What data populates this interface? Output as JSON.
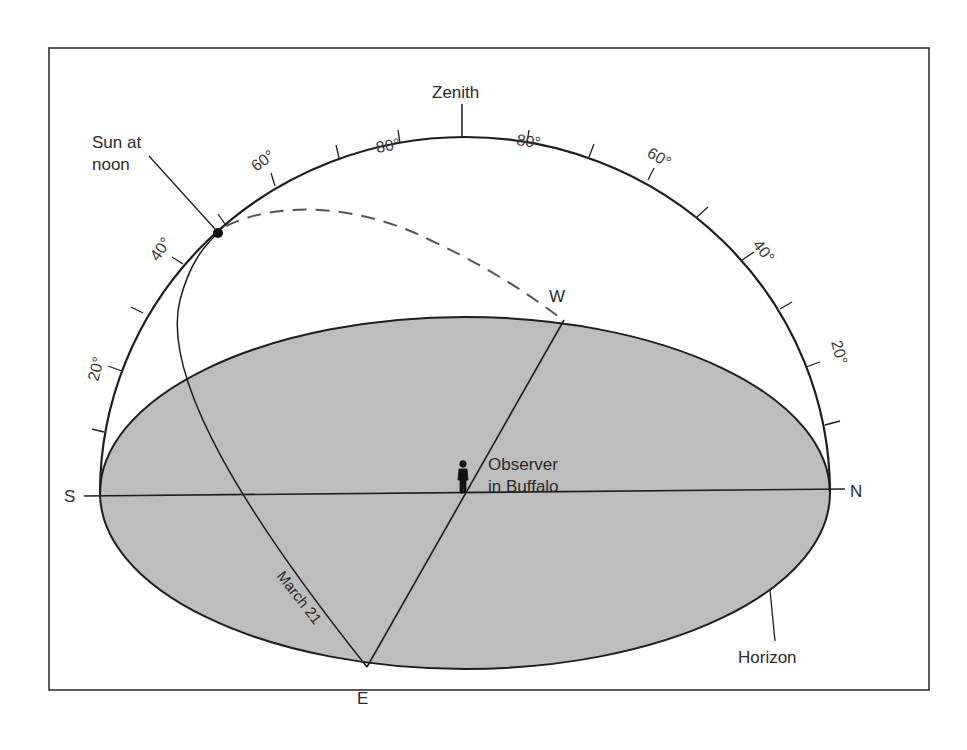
{
  "diagram": {
    "type": "celestial-sphere",
    "labels": {
      "zenith": "Zenith",
      "sun_at_noon_line1": "Sun at",
      "sun_at_noon_line2": "noon",
      "west": "W",
      "east": "E",
      "south": "S",
      "north": "N",
      "observer_line1": "Observer",
      "observer_line2": "in Buffalo",
      "sun_path_date": "March 21",
      "horizon": "Horizon"
    },
    "meridian_degree_labels": {
      "south_side": [
        "20°",
        "40°",
        "60°",
        "80°"
      ],
      "north_side": [
        "80°",
        "60°",
        "40°",
        "20°"
      ]
    },
    "colors": {
      "horizon_fill": "#bdbdbd",
      "line": "#1e1e1e",
      "frame": "#333333",
      "background": "#ffffff"
    }
  }
}
